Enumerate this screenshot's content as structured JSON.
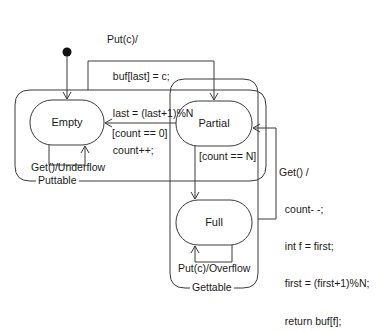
{
  "diagram": {
    "type": "UML state machine",
    "regions": [
      {
        "id": "puttable",
        "label": "Puttable"
      },
      {
        "id": "gettable",
        "label": "Gettable"
      }
    ],
    "states": [
      {
        "id": "empty",
        "label": "Empty"
      },
      {
        "id": "partial",
        "label": "Partial"
      },
      {
        "id": "full",
        "label": "Full"
      }
    ],
    "transitions": {
      "put": {
        "line1": "Put(c)/",
        "line2": "  buf[last] = c;",
        "line3": "  last = (last+1)%N",
        "line4": "  count++;"
      },
      "to_empty_guard": "[count == 0]",
      "to_full_guard": "[count == N]",
      "empty_self": "Get()/Underflow",
      "full_self": "Put(c)/Overflow",
      "get": {
        "line1": "Get() /",
        "line2": "  count- -;",
        "line3": "  int f = first;",
        "line4": "  first = (first+1)%N;",
        "line5": "  return buf[f];"
      }
    },
    "colors": {
      "stroke": "#3a3a3a",
      "text": "#1a1a1a",
      "background": "#ffffff"
    }
  }
}
